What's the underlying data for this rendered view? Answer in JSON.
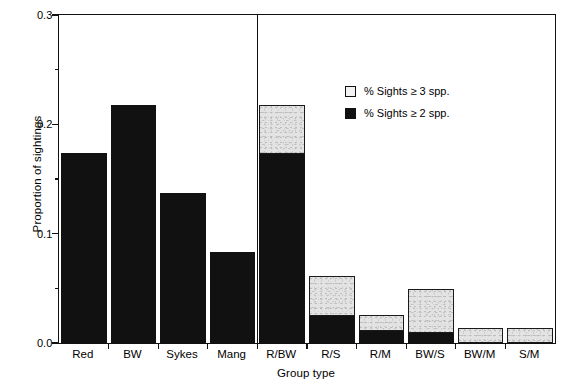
{
  "chart_data": {
    "type": "bar",
    "subtype": "stacked",
    "title": "",
    "xlabel": "Group type",
    "ylabel": "Proportion of sightings",
    "ylim": [
      0.0,
      0.3
    ],
    "ytick_labels": [
      "0.0",
      "0.1",
      "0.2",
      "0.3"
    ],
    "ytick_values": [
      0.0,
      0.1,
      0.2,
      0.3
    ],
    "yminor_values": [
      0.05,
      0.15,
      0.25
    ],
    "grid": false,
    "legend_position": "upper right inside",
    "categories": [
      "Red",
      "BW",
      "Sykes",
      "Mang",
      "R/BW",
      "R/S",
      "R/M",
      "BW/S",
      "BW/M",
      "S/M"
    ],
    "series": [
      {
        "name": "% Sights ≥ 2 spp.",
        "color": "#111111",
        "values": [
          0.174,
          0.218,
          0.137,
          0.083,
          0.173,
          0.025,
          0.011,
          0.009,
          0.0,
          0.0
        ]
      },
      {
        "name": "% Sights ≥ 3 spp.",
        "color": "#e3e3e3",
        "values": [
          0.0,
          0.0,
          0.0,
          0.0,
          0.045,
          0.036,
          0.015,
          0.04,
          0.014,
          0.014
        ]
      }
    ],
    "totals": [
      0.174,
      0.218,
      0.137,
      0.083,
      0.218,
      0.061,
      0.026,
      0.049,
      0.014,
      0.014
    ],
    "annotations": [
      "vertical divider separating single-species groups (Red, BW, Sykes, Mang) from mixed-species groups"
    ]
  },
  "legend": {
    "entries": [
      {
        "label": "% Sights ≥ 3 spp.",
        "swatch": "gray"
      },
      {
        "label": "% Sights ≥ 2 spp.",
        "swatch": "black"
      }
    ]
  },
  "axes": {
    "x_title": "Group type",
    "y_title": "Proportion of sightings"
  }
}
